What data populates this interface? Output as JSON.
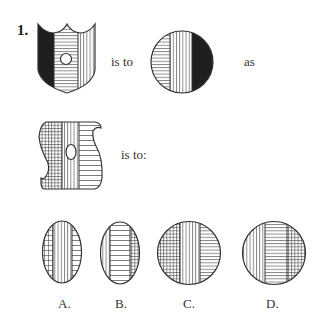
{
  "question": {
    "number": "1.",
    "connector_1": "is to",
    "connector_2": "as",
    "connector_3": "is to:",
    "figures": {
      "first": "shield-shape: left black, middle horizontal lines with small circle, right vertical lines",
      "second": "circle: left horizontal lines, middle vertical lines, right black",
      "third": "S-shape: left grid, middle vertical lines with oval, right horizontal lines"
    },
    "options": [
      {
        "label": "A.",
        "shape": "oval",
        "left": "grid",
        "middle": "vertical",
        "right": "horizontal"
      },
      {
        "label": "B.",
        "shape": "oval",
        "left": "vertical",
        "middle": "horizontal",
        "right": "grid"
      },
      {
        "label": "C.",
        "shape": "circle",
        "left": "grid",
        "middle": "vertical",
        "right": "horizontal"
      },
      {
        "label": "D.",
        "shape": "circle",
        "left": "vertical",
        "middle": "horizontal",
        "right": "grid"
      }
    ]
  }
}
